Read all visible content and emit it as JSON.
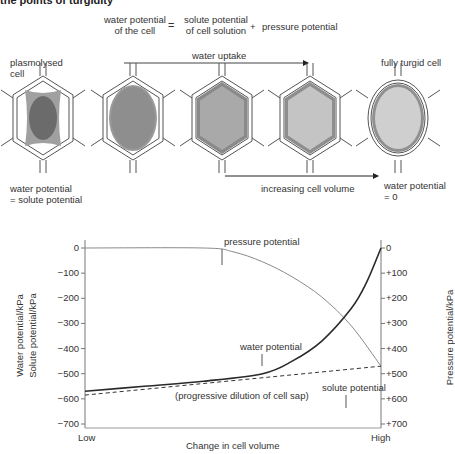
{
  "title": "the points of turgidity",
  "equation": {
    "lhs": [
      "water potential",
      "of the cell"
    ],
    "equals": "=",
    "term1": [
      "solute potential",
      "of cell solution"
    ],
    "plus": "+",
    "term2": "pressure potential"
  },
  "diagram": {
    "left_label": [
      "plasmolysed",
      "cell"
    ],
    "right_label": "fully turgid cell",
    "top_arrow_label": "water uptake",
    "bottom_arrow_label": "increasing cell volume",
    "bottom_left_label": [
      "water potential",
      "= solute potential"
    ],
    "bottom_right_label": [
      "water potential",
      "= 0"
    ],
    "cells": [
      {
        "stage": "plasmolysed",
        "vacuole_color": "#6b6b6b",
        "cytoplasm_color": "#a0a0a0"
      },
      {
        "stage": "incipient",
        "vacuole_color": "#8e8e8e",
        "cytoplasm_color": "#9a9a9a"
      },
      {
        "stage": "filling",
        "vacuole_color": "#a9a9a9",
        "cytoplasm_color": "#8a8a8a"
      },
      {
        "stage": "nearly turgid",
        "vacuole_color": "#c4c4c4",
        "cytoplasm_color": "#8e8e8e"
      },
      {
        "stage": "fully turgid",
        "vacuole_color": "#cfcfcf",
        "cytoplasm_color": "#909090"
      }
    ]
  },
  "chart_data": {
    "type": "line",
    "title": "",
    "xlabel": "Change in cell volume",
    "x_ticks": [
      "Low",
      "High"
    ],
    "x_range": [
      0,
      1
    ],
    "ylabel_left": [
      "Water potential/kPa",
      "Solute potential/kPa"
    ],
    "ylabel_right": "Pressure potential/kPa",
    "ylim": [
      -700,
      0
    ],
    "y_ticks_left": [
      "0",
      "−100",
      "−200",
      "−300",
      "−400",
      "−500",
      "−600",
      "−700"
    ],
    "y_ticks_right": [
      "0",
      "+100",
      "+200",
      "+300",
      "+400",
      "+500",
      "+600",
      "+700"
    ],
    "series": [
      {
        "name": "pressure potential",
        "style": "solid-gray",
        "color": "#8a8a8a",
        "x": [
          0,
          0.4,
          0.5,
          0.6,
          0.7,
          0.8,
          0.9,
          1.0
        ],
        "y": [
          0,
          0,
          -15,
          -55,
          -115,
          -195,
          -310,
          -470
        ]
      },
      {
        "name": "water potential",
        "style": "solid-dark",
        "color": "#2a2a2a",
        "x": [
          0,
          0.2,
          0.4,
          0.6,
          0.7,
          0.8,
          0.9,
          0.95,
          1.0
        ],
        "y": [
          -570,
          -550,
          -530,
          -500,
          -450,
          -370,
          -240,
          -140,
          0
        ]
      },
      {
        "name": "solute potential",
        "style": "dashed",
        "color": "#333333",
        "x": [
          0,
          1.0
        ],
        "y": [
          -585,
          -470
        ]
      }
    ],
    "annotations": [
      "pressure potential",
      "water potential",
      "solute potential",
      "(progressive dilution of cell sap)"
    ]
  }
}
